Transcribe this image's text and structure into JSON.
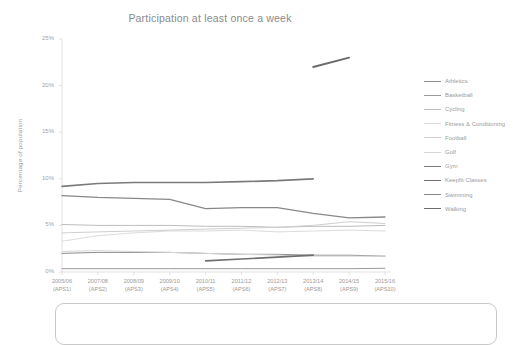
{
  "chart_data": {
    "type": "line",
    "title": "Participation at least once a week",
    "xlabel": "",
    "ylabel": "Percentage of population",
    "ylim": [
      0,
      25
    ],
    "yticks": [
      "0%",
      "5%",
      "10%",
      "15%",
      "20%",
      "25%"
    ],
    "ytick_values": [
      0,
      5,
      10,
      15,
      20,
      25
    ],
    "grid": false,
    "legend_position": "right",
    "categories": [
      "2005/06\n(APS1)",
      "2007/08\n(APS2)",
      "2008/09\n(APS3)",
      "2009/10\n(APS4)",
      "2010/11\n(APS5)",
      "2011/12\n(APS6)",
      "2012/13\n(APS7)",
      "2013/14\n(APS8)",
      "2014/15\n(APS9)",
      "2015/16\n(APS10)"
    ],
    "category_lines": [
      [
        "2005/06",
        "(APS1)"
      ],
      [
        "2007/08",
        "(APS2)"
      ],
      [
        "2008/09",
        "(APS3)"
      ],
      [
        "2009/10",
        "(APS4)"
      ],
      [
        "2010/11",
        "(APS5)"
      ],
      [
        "2011/12",
        "(APS6)"
      ],
      [
        "2012/13",
        "(APS7)"
      ],
      [
        "2013/14",
        "(APS8)"
      ],
      [
        "2014/15",
        "(APS9)"
      ],
      [
        "2015/16",
        "(APS10)"
      ]
    ],
    "series": [
      {
        "name": "Athletics",
        "color": "#8d8d8d",
        "width": 1.0,
        "values": [
          2.0,
          2.1,
          2.1,
          2.1,
          2.0,
          1.9,
          1.9,
          1.8,
          1.8,
          1.7
        ]
      },
      {
        "name": "Basketball",
        "color": "#9a9a9a",
        "width": 1.0,
        "values": [
          0.35,
          0.35,
          0.35,
          0.35,
          0.35,
          0.35,
          0.35,
          0.35,
          0.35,
          0.4
        ]
      },
      {
        "name": "Cycling",
        "color": "#bdbdbd",
        "width": 1.0,
        "values": [
          5.1,
          5.0,
          5.0,
          5.0,
          4.9,
          4.9,
          4.8,
          4.9,
          4.9,
          5.0
        ]
      },
      {
        "name": "Fitness & Conditioning",
        "color": "#dcdcdc",
        "width": 1.0,
        "values": [
          3.3,
          3.9,
          4.2,
          4.4,
          4.4,
          4.5,
          4.3,
          4.4,
          4.5,
          4.4
        ]
      },
      {
        "name": "Football",
        "color": "#cfcfcf",
        "width": 1.0,
        "values": [
          4.2,
          4.3,
          4.4,
          4.5,
          4.6,
          4.7,
          4.8,
          5.0,
          5.4,
          5.2
        ]
      },
      {
        "name": "Golf",
        "color": "#d6d6d6",
        "width": 1.0,
        "values": [
          2.2,
          2.3,
          2.2,
          2.1,
          2.0,
          1.9,
          1.8,
          1.7,
          1.7,
          1.7
        ]
      },
      {
        "name": "Gym",
        "color": "#7b7b7b",
        "width": 1.7,
        "values": [
          9.2,
          9.5,
          9.6,
          9.6,
          9.6,
          9.7,
          9.8,
          10.0,
          null,
          null
        ]
      },
      {
        "name": "Keepfit Classes",
        "color": "#6f6f6f",
        "width": 1.7,
        "values": [
          null,
          null,
          null,
          null,
          1.2,
          1.4,
          1.6,
          1.8,
          null,
          null
        ]
      },
      {
        "name": "Swimming",
        "color": "#888888",
        "width": 1.3,
        "values": [
          8.2,
          8.0,
          7.9,
          7.8,
          6.8,
          6.9,
          6.9,
          6.3,
          5.8,
          5.9
        ]
      },
      {
        "name": "Walking",
        "color": "#6a6a6a",
        "width": 1.9,
        "values": [
          null,
          null,
          null,
          null,
          null,
          null,
          null,
          22.0,
          23.0,
          null
        ]
      }
    ],
    "annotations": []
  },
  "legend": {
    "entries": [
      "Athletics",
      "Basketball",
      "Cycling",
      "Fitness & Conditioning",
      "Football",
      "Golf",
      "Gym",
      "Keepfit Classes",
      "Swimming",
      "Walking"
    ]
  },
  "colors": {
    "axis": "#d9d9d9",
    "text": "#9a9a9a",
    "background": "#ffffff",
    "callout_border": "#c9c9c9"
  }
}
